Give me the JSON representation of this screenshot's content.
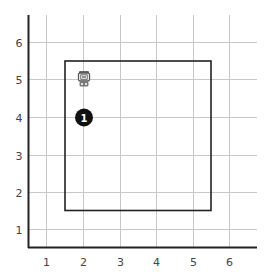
{
  "diagram": {
    "type": "grid-coordinate-plot",
    "x_axis": {
      "ticks": [
        "1",
        "2",
        "3",
        "4",
        "5",
        "6"
      ],
      "range": [
        0.5,
        6.8
      ]
    },
    "y_axis": {
      "ticks": [
        "1",
        "2",
        "3",
        "4",
        "5",
        "6"
      ],
      "range": [
        0.5,
        6.9
      ]
    },
    "grid": true,
    "boundary_rectangle": {
      "x_min": 1.5,
      "x_max": 5.5,
      "y_min": 1.5,
      "y_max": 5.5
    },
    "markers": [
      {
        "id": "marker-1",
        "label": "1",
        "x": 2,
        "y": 4,
        "style": "black-circle"
      }
    ],
    "icons": [
      {
        "id": "robot",
        "icon": "robot-icon",
        "x": 2,
        "y": 5
      }
    ],
    "colors": {
      "axis": "#222222",
      "grid": "#c8c8c8",
      "rectangle": "#222222",
      "marker_fill": "#111111",
      "marker_text": "#ffffff"
    }
  }
}
